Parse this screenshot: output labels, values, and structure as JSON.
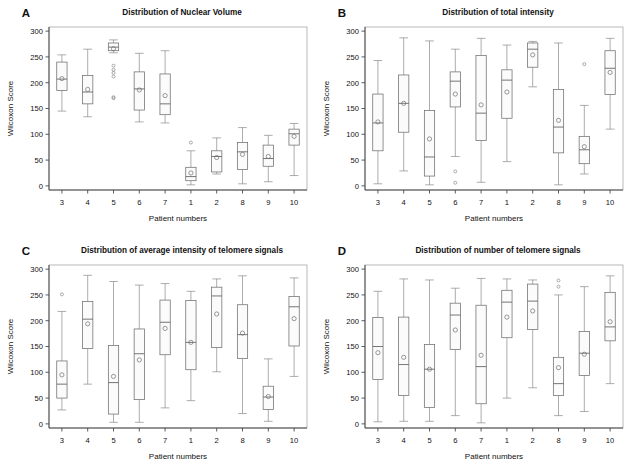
{
  "figure": {
    "axis": {
      "ylabel": "Wilcoxon Score",
      "xlabel": "Patient numbers",
      "yticks": [
        0,
        50,
        100,
        150,
        200,
        250,
        300
      ],
      "ylim": [
        -8,
        308
      ],
      "categories": [
        "3",
        "4",
        "5",
        "6",
        "7",
        "1",
        "2",
        "8",
        "9",
        "10"
      ]
    },
    "panels": [
      {
        "letter": "A",
        "title": "Distribution of Nuclear Volume",
        "chart_data": {
          "type": "box",
          "title": "Distribution of Nuclear Volume",
          "xlabel": "Patient numbers",
          "ylabel": "Wilcoxon Score",
          "ylim": [
            0,
            300
          ],
          "categories": [
            "3",
            "4",
            "5",
            "6",
            "7",
            "1",
            "2",
            "8",
            "9",
            "10"
          ],
          "boxes": [
            {
              "category": "3",
              "min": 145,
              "q1": 185,
              "median": 207,
              "q3": 240,
              "max": 254,
              "mean": 208,
              "outliers": []
            },
            {
              "category": "4",
              "min": 134,
              "q1": 159,
              "median": 182,
              "q3": 214,
              "max": 265,
              "mean": 187,
              "outliers": []
            },
            {
              "category": "5",
              "min": 258,
              "q1": 262,
              "median": 269,
              "q3": 277,
              "max": 283,
              "mean": 266,
              "outliers": [
                233,
                225,
                219,
                212,
                172,
                170
              ]
            },
            {
              "category": "6",
              "min": 124,
              "q1": 147,
              "median": 188,
              "q3": 221,
              "max": 257,
              "mean": 186,
              "outliers": []
            },
            {
              "category": "7",
              "min": 122,
              "q1": 138,
              "median": 159,
              "q3": 217,
              "max": 262,
              "mean": 175,
              "outliers": []
            },
            {
              "category": "1",
              "min": 2,
              "q1": 10,
              "median": 18,
              "q3": 36,
              "max": 68,
              "mean": 25,
              "outliers": [
                84
              ]
            },
            {
              "category": "2",
              "min": 23,
              "q1": 27,
              "median": 57,
              "q3": 68,
              "max": 93,
              "mean": 55,
              "outliers": []
            },
            {
              "category": "8",
              "min": 4,
              "q1": 32,
              "median": 66,
              "q3": 84,
              "max": 113,
              "mean": 61,
              "outliers": []
            },
            {
              "category": "9",
              "min": 8,
              "q1": 38,
              "median": 53,
              "q3": 79,
              "max": 98,
              "mean": 57,
              "outliers": []
            },
            {
              "category": "10",
              "min": 20,
              "q1": 79,
              "median": 101,
              "q3": 110,
              "max": 121,
              "mean": 96,
              "outliers": []
            }
          ]
        }
      },
      {
        "letter": "B",
        "title": "Distribution of total intensity",
        "chart_data": {
          "type": "box",
          "title": "Distribution of total intensity",
          "xlabel": "Patient numbers",
          "ylabel": "Wilcoxon Score",
          "ylim": [
            0,
            300
          ],
          "categories": [
            "3",
            "4",
            "5",
            "6",
            "7",
            "1",
            "2",
            "8",
            "9",
            "10"
          ],
          "boxes": [
            {
              "category": "3",
              "min": 4,
              "q1": 68,
              "median": 122,
              "q3": 178,
              "max": 243,
              "mean": 124,
              "outliers": []
            },
            {
              "category": "4",
              "min": 29,
              "q1": 104,
              "median": 160,
              "q3": 215,
              "max": 287,
              "mean": 160,
              "outliers": []
            },
            {
              "category": "5",
              "min": 2,
              "q1": 19,
              "median": 56,
              "q3": 146,
              "max": 281,
              "mean": 91,
              "outliers": []
            },
            {
              "category": "6",
              "min": 57,
              "q1": 153,
              "median": 203,
              "q3": 221,
              "max": 265,
              "mean": 178,
              "outliers": [
                28,
                6
              ]
            },
            {
              "category": "7",
              "min": 7,
              "q1": 88,
              "median": 141,
              "q3": 253,
              "max": 286,
              "mean": 157,
              "outliers": []
            },
            {
              "category": "1",
              "min": 47,
              "q1": 131,
              "median": 205,
              "q3": 225,
              "max": 273,
              "mean": 182,
              "outliers": []
            },
            {
              "category": "2",
              "min": 192,
              "q1": 230,
              "median": 265,
              "q3": 277,
              "max": 280,
              "mean": 254,
              "outliers": []
            },
            {
              "category": "8",
              "min": 2,
              "q1": 64,
              "median": 114,
              "q3": 187,
              "max": 277,
              "mean": 127,
              "outliers": []
            },
            {
              "category": "9",
              "min": 23,
              "q1": 43,
              "median": 70,
              "q3": 96,
              "max": 156,
              "mean": 76,
              "outliers": [
                236
              ]
            },
            {
              "category": "10",
              "min": 110,
              "q1": 177,
              "median": 228,
              "q3": 262,
              "max": 286,
              "mean": 220,
              "outliers": []
            }
          ]
        }
      },
      {
        "letter": "C",
        "title": "Distribution of average intensity of telomere signals",
        "chart_data": {
          "type": "box",
          "title": "Distribution of average intensity of telomere signals",
          "xlabel": "Patient numbers",
          "ylabel": "Wilcoxon Score",
          "ylim": [
            0,
            300
          ],
          "categories": [
            "3",
            "4",
            "5",
            "6",
            "7",
            "1",
            "2",
            "8",
            "9",
            "10"
          ],
          "boxes": [
            {
              "category": "3",
              "min": 27,
              "q1": 50,
              "median": 77,
              "q3": 122,
              "max": 218,
              "mean": 95,
              "outliers": [
                251
              ]
            },
            {
              "category": "4",
              "min": 77,
              "q1": 146,
              "median": 203,
              "q3": 237,
              "max": 288,
              "mean": 194,
              "outliers": []
            },
            {
              "category": "5",
              "min": 3,
              "q1": 19,
              "median": 80,
              "q3": 152,
              "max": 276,
              "mean": 92,
              "outliers": []
            },
            {
              "category": "6",
              "min": 3,
              "q1": 47,
              "median": 136,
              "q3": 184,
              "max": 269,
              "mean": 124,
              "outliers": []
            },
            {
              "category": "7",
              "min": 31,
              "q1": 134,
              "median": 197,
              "q3": 240,
              "max": 272,
              "mean": 185,
              "outliers": []
            },
            {
              "category": "1",
              "min": 45,
              "q1": 105,
              "median": 158,
              "q3": 239,
              "max": 257,
              "mean": 158,
              "outliers": []
            },
            {
              "category": "2",
              "min": 101,
              "q1": 148,
              "median": 248,
              "q3": 265,
              "max": 281,
              "mean": 213,
              "outliers": []
            },
            {
              "category": "8",
              "min": 20,
              "q1": 127,
              "median": 173,
              "q3": 231,
              "max": 287,
              "mean": 176,
              "outliers": []
            },
            {
              "category": "9",
              "min": 5,
              "q1": 28,
              "median": 52,
              "q3": 73,
              "max": 126,
              "mean": 53,
              "outliers": []
            },
            {
              "category": "10",
              "min": 92,
              "q1": 151,
              "median": 227,
              "q3": 247,
              "max": 283,
              "mean": 204,
              "outliers": []
            }
          ]
        }
      },
      {
        "letter": "D",
        "title": "Distribution of number of telomere signals",
        "chart_data": {
          "type": "box",
          "title": "Distribution of number of telomere signals",
          "xlabel": "Patient numbers",
          "ylabel": "Wilcoxon Score",
          "ylim": [
            0,
            300
          ],
          "categories": [
            "3",
            "4",
            "5",
            "6",
            "7",
            "1",
            "2",
            "8",
            "9",
            "10"
          ],
          "boxes": [
            {
              "category": "3",
              "min": 4,
              "q1": 86,
              "median": 150,
              "q3": 206,
              "max": 257,
              "mean": 138,
              "outliers": []
            },
            {
              "category": "4",
              "min": 5,
              "q1": 55,
              "median": 115,
              "q3": 207,
              "max": 281,
              "mean": 129,
              "outliers": []
            },
            {
              "category": "5",
              "min": 5,
              "q1": 32,
              "median": 106,
              "q3": 154,
              "max": 279,
              "mean": 106,
              "outliers": []
            },
            {
              "category": "6",
              "min": 16,
              "q1": 144,
              "median": 211,
              "q3": 234,
              "max": 263,
              "mean": 182,
              "outliers": []
            },
            {
              "category": "7",
              "min": 2,
              "q1": 39,
              "median": 111,
              "q3": 230,
              "max": 282,
              "mean": 133,
              "outliers": []
            },
            {
              "category": "1",
              "min": 50,
              "q1": 167,
              "median": 236,
              "q3": 259,
              "max": 281,
              "mean": 207,
              "outliers": []
            },
            {
              "category": "2",
              "min": 70,
              "q1": 183,
              "median": 238,
              "q3": 271,
              "max": 279,
              "mean": 219,
              "outliers": []
            },
            {
              "category": "8",
              "min": 16,
              "q1": 55,
              "median": 78,
              "q3": 129,
              "max": 250,
              "mean": 109,
              "outliers": [
                278,
                266
              ]
            },
            {
              "category": "9",
              "min": 24,
              "q1": 94,
              "median": 137,
              "q3": 179,
              "max": 266,
              "mean": 135,
              "outliers": []
            },
            {
              "category": "10",
              "min": 78,
              "q1": 161,
              "median": 188,
              "q3": 255,
              "max": 287,
              "mean": 198,
              "outliers": []
            }
          ]
        }
      }
    ]
  }
}
